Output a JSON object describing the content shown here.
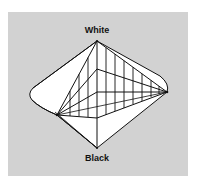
{
  "diagram": {
    "labels": {
      "top": "White",
      "bottom": "Black"
    },
    "colors": {
      "background": "#ffffff",
      "panel": "#d2d2d2",
      "fill": "#ffffff",
      "stroke": "#111111"
    },
    "vertices": {
      "white": [
        97,
        41
      ],
      "black": [
        97,
        148
      ],
      "right": [
        167,
        92
      ],
      "left_inner": [
        57,
        115
      ],
      "left_outer": [
        30,
        93
      ],
      "center_upper": [
        97,
        69
      ],
      "center_mid": [
        97,
        92
      ],
      "center_lower": [
        97,
        118
      ]
    }
  }
}
